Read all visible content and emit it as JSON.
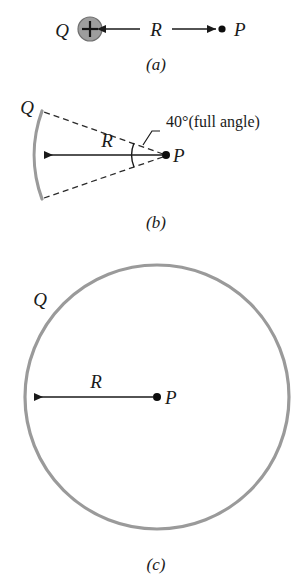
{
  "figure": {
    "panels": [
      {
        "id": "a",
        "caption": "(a)",
        "charge_label": "Q",
        "distance_label": "R",
        "point_label": "P",
        "charge_sign": "+"
      },
      {
        "id": "b",
        "caption": "(b)",
        "charge_label": "Q",
        "distance_label": "R",
        "point_label": "P",
        "angle_label": "40°(full angle)"
      },
      {
        "id": "c",
        "caption": "(c)",
        "charge_label": "Q",
        "distance_label": "R",
        "point_label": "P"
      }
    ],
    "colors": {
      "charge_gray": "#9a9a9a",
      "ink": "#1a1a1a",
      "sphere_fill": "#9d9d9d",
      "background": "#ffffff"
    }
  }
}
